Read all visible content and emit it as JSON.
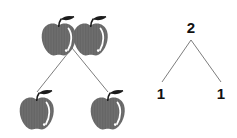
{
  "diagram": {
    "background_color": "#ffffff",
    "line_color": "#6e6e6e",
    "apple_body_color": "#6f6f6f",
    "apple_stem_color": "#1c1c1c",
    "number_color": "#111111"
  },
  "pictorial": {
    "label": "Apple number bond",
    "root_group": {
      "label": "two apples",
      "count": 2,
      "items": [
        {
          "label": "apple",
          "icon": "apple-icon"
        },
        {
          "label": "apple",
          "icon": "apple-icon"
        }
      ]
    },
    "left_group": {
      "label": "one apple",
      "count": 1,
      "items": [
        {
          "label": "apple",
          "icon": "apple-icon"
        }
      ]
    },
    "right_group": {
      "label": "one apple",
      "count": 1,
      "items": [
        {
          "label": "apple",
          "icon": "apple-icon"
        }
      ]
    }
  },
  "numeric": {
    "label": "Numeric number bond",
    "root": "2",
    "left_leaf": "1",
    "right_leaf": "1"
  }
}
